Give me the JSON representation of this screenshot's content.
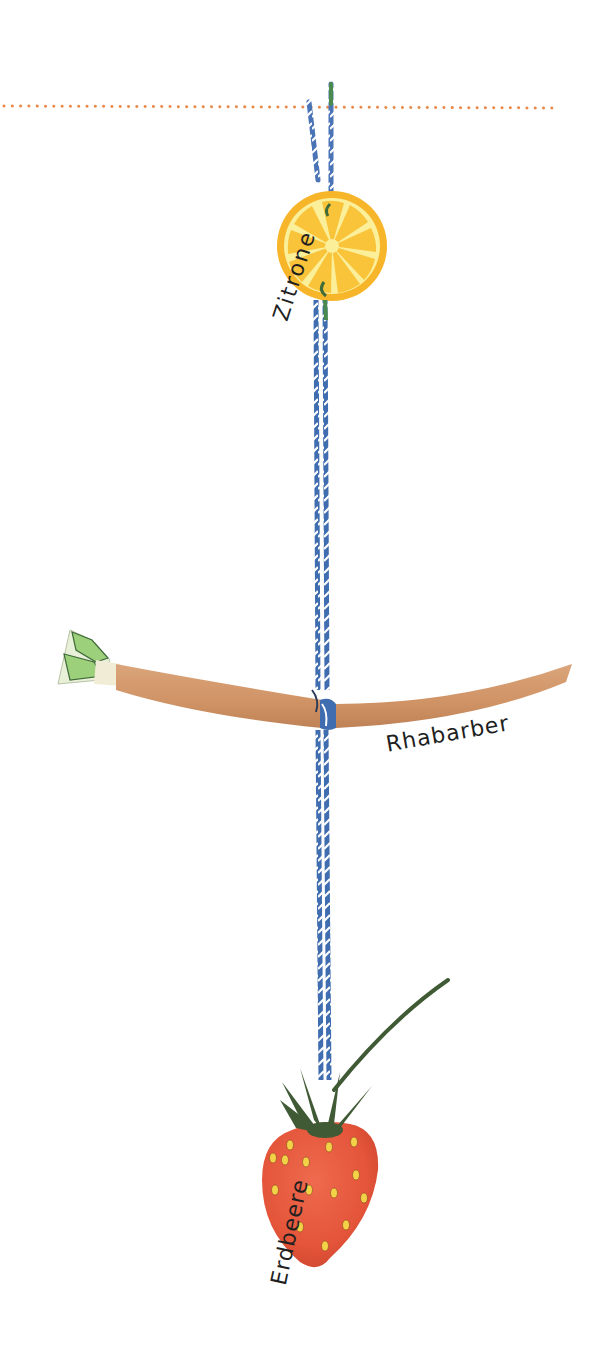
{
  "illustration": {
    "labels": {
      "lemon": "Zitrone",
      "rhubarb": "Rhabarber",
      "strawberry": "Erdbeere"
    },
    "colors": {
      "dotted_line": "#e8894a",
      "string_blue": "#3f6db0",
      "string_green": "#4b8a4f",
      "lemon_rind": "#f7b52a",
      "lemon_flesh": "#f9c53c",
      "lemon_pith": "#fbef9a",
      "rhubarb_stalk": "#d39a6b",
      "rhubarb_leaf": "#9cd07a",
      "strawberry_body": "#e8583c",
      "strawberry_seed": "#f3d247",
      "strawberry_leaf": "#3f5a34"
    }
  }
}
